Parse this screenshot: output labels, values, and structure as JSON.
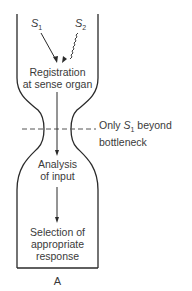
{
  "diagram": {
    "type": "bottleneck-attention-model",
    "stimuli": [
      {
        "symbol": "S",
        "subscript": "1",
        "path": "straight"
      },
      {
        "symbol": "S",
        "subscript": "2",
        "path": "wavy"
      }
    ],
    "stages": [
      {
        "line1": "Registration",
        "line2": "at sense organ"
      },
      {
        "line1": "Analysis",
        "line2": "of input"
      },
      {
        "line1": "Selection of",
        "line2": "appropriate",
        "line3": "response"
      }
    ],
    "bottleneck_label": {
      "prefix": "Only ",
      "symbol": "S",
      "subscript": "1",
      "suffix": " beyond",
      "line2": "bottleneck"
    },
    "panel_label": "A",
    "colors": {
      "stroke": "#2a2a2a",
      "text": "#3a3a3a",
      "background": "#ffffff"
    }
  }
}
